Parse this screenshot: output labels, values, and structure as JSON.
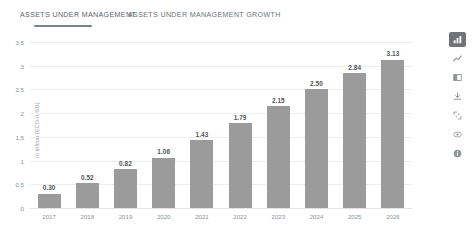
{
  "tabs": [
    {
      "label": "ASSETS UNDER MANAGEMENT",
      "active": true
    },
    {
      "label": "ASSETS UNDER MANAGEMENT GROWTH",
      "active": false
    }
  ],
  "toolbar": {
    "items": [
      {
        "icon": "bar-chart-icon",
        "selected": true
      },
      {
        "icon": "line-chart-icon",
        "selected": false
      },
      {
        "icon": "table-icon",
        "selected": false
      },
      {
        "icon": "download-icon",
        "selected": false
      },
      {
        "icon": "expand-icon",
        "selected": false
      },
      {
        "icon": "eye-icon",
        "selected": false
      },
      {
        "icon": "info-icon",
        "selected": false
      }
    ]
  },
  "colors": {
    "bar": "#9b9b9b",
    "grid": "#ededef",
    "tab_underline": "#7d8388",
    "toolbar_selected": "#6f7479",
    "text": "#8b9196",
    "value_text": "#4f5458"
  },
  "chart_data": {
    "type": "bar",
    "title": "",
    "xlabel": "",
    "ylabel": "in trillion (ECD-IUSD)",
    "ylim": [
      0,
      3.5
    ],
    "yticks": [
      "0",
      "0.5",
      "1",
      "1.5",
      "2",
      "2.5",
      "3",
      "3.5"
    ],
    "grid": true,
    "legend": "none",
    "categories": [
      "2017",
      "2018",
      "2019",
      "2020",
      "2021",
      "2022",
      "2023",
      "2024",
      "2025",
      "2026"
    ],
    "values": [
      0.3,
      0.52,
      0.82,
      1.06,
      1.43,
      1.79,
      2.15,
      2.5,
      2.84,
      3.13
    ],
    "value_labels": [
      "0.30",
      "0.52",
      "0.82",
      "1.06",
      "1.43",
      "1.79",
      "2.15",
      "2.50",
      "2.84",
      "3.13"
    ]
  }
}
